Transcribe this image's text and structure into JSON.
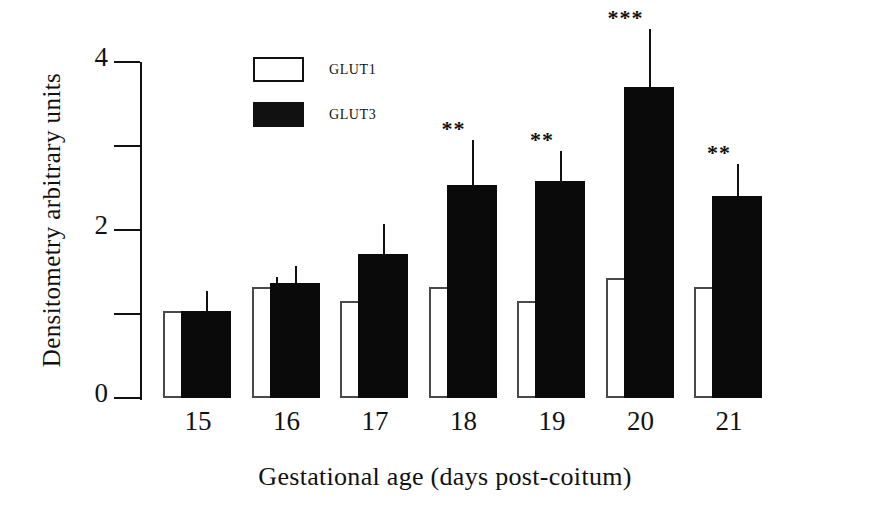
{
  "chart_data": {
    "type": "bar",
    "title": "",
    "xlabel": "Gestational age (days post-coitum)",
    "ylabel": "Densitometry arbitrary units",
    "categories": [
      "15",
      "16",
      "17",
      "18",
      "19",
      "20",
      "21"
    ],
    "ylim": [
      0,
      4
    ],
    "yticks": [
      0,
      2,
      4
    ],
    "ytick_labels": [
      "0",
      "2",
      "4"
    ],
    "yminor_ticks": [
      1,
      3
    ],
    "grid": false,
    "legend_position": "top-left-inside",
    "series": [
      {
        "name": "GLUT1",
        "color": "#ffffff",
        "style": "open",
        "values": [
          1.03,
          1.32,
          1.15,
          1.32,
          1.16,
          1.43,
          1.32
        ],
        "errors": [
          0.0,
          0.12,
          0.0,
          0.0,
          0.0,
          0.0,
          0.0
        ]
      },
      {
        "name": "GLUT3",
        "color": "#0a0a0a",
        "style": "filled",
        "values": [
          1.03,
          1.37,
          1.72,
          2.53,
          2.58,
          3.7,
          2.4
        ],
        "errors": [
          0.24,
          0.2,
          0.35,
          0.54,
          0.36,
          0.69,
          0.39
        ]
      }
    ],
    "annotations": [
      {
        "category": "18",
        "text": "**"
      },
      {
        "category": "19",
        "text": "**"
      },
      {
        "category": "20",
        "text": "***"
      },
      {
        "category": "21",
        "text": "**"
      }
    ]
  },
  "legend": {
    "entries": [
      {
        "label": "GLUT1",
        "style": "open"
      },
      {
        "label": "GLUT3",
        "style": "filled"
      }
    ]
  }
}
